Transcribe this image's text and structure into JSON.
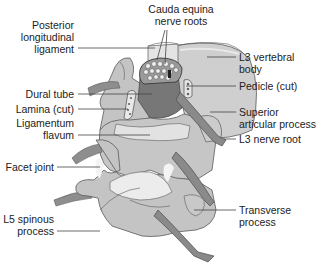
{
  "colors": {
    "bone": "#c8c8c8",
    "bone_light": "#dcdcdc",
    "bone_dark": "#a8a8a8",
    "nerve": "#8a8a8a",
    "dural": "#7a7a7a",
    "outline": "#5a5a5a",
    "leader": "#444444",
    "text": "#222222",
    "highlight": "#f2f2f2"
  },
  "labels": {
    "cauda_equina": [
      "Cauda equina",
      "nerve roots"
    ],
    "posterior_ligament": [
      "Posterior",
      "longitudinal",
      "ligament"
    ],
    "l3_body": [
      "L3 vertebral",
      "body"
    ],
    "pedicle": [
      "Pedicle (cut)"
    ],
    "dural_tube": [
      "Dural tube"
    ],
    "lamina": [
      "Lamina (cut)"
    ],
    "ligamentum_flavum": [
      "Ligamentum",
      "flavum"
    ],
    "superior_articular": [
      "Superior",
      "articular process"
    ],
    "l3_nerve_root": [
      "L3 nerve root"
    ],
    "facet_joint": [
      "Facet joint"
    ],
    "l5_spinous": [
      "L5 spinous",
      "process"
    ],
    "transverse": [
      "Transverse",
      "process"
    ]
  }
}
